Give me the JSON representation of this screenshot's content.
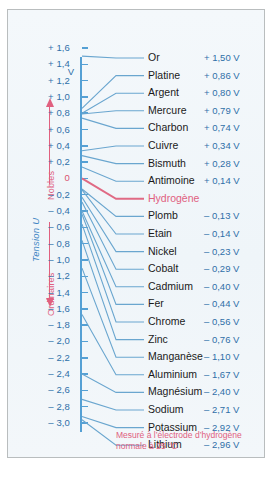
{
  "figure": {
    "axis": {
      "title": "Tension U",
      "unit": "V",
      "zone_upper": "Nobles",
      "zone_lower": "Ordinaires",
      "ticks": [
        "+ 1,6",
        "+ 1,4",
        "+ 1,2",
        "+ 1,0",
        "+ 0,8",
        "+ 0,6",
        "+ 0,4",
        "+ 0,2",
        "0",
        "– 0,2",
        "– 0,4",
        "– 0,6",
        "– 0,8",
        "– 1,0",
        "– 1,2",
        "– 1,4",
        "– 1,6",
        "– 1,8",
        "– 2,0",
        "– 2,2",
        "– 2,4",
        "– 2,6",
        "– 2,8",
        "– 3,0"
      ]
    },
    "caption": "Mesuré à l’électrode d’hydrogène normale à 25 °C",
    "colors": {
      "accent_blue": "#2f6fa8",
      "axis_blue": "#55a0d4",
      "highlight_red": "#e0607f",
      "background": "#f2f7fb"
    }
  },
  "chart_data": {
    "type": "scatter",
    "title": "Tension U",
    "xlabel": "",
    "ylabel": "Tension U",
    "unit": "V",
    "ylim": [
      -3.0,
      1.6
    ],
    "grid": false,
    "legend": "none",
    "annotations": [
      "Nobles",
      "Ordinaires",
      "Mesuré à l’électrode d’hydrogène normale à 25 °C"
    ],
    "tick_labels": [
      "+ 1,6",
      "+ 1,4",
      "+ 1,2",
      "+ 1,0",
      "+ 0,8",
      "+ 0,6",
      "+ 0,4",
      "+ 0,2",
      "0",
      "– 0,2",
      "– 0,4",
      "– 0,6",
      "– 0,8",
      "– 1,0",
      "– 1,2",
      "– 1,4",
      "– 1,6",
      "– 1,8",
      "– 2,0",
      "– 2,2",
      "– 2,4",
      "– 2,6",
      "– 2,8",
      "– 3,0"
    ],
    "categories": [
      "Or",
      "Platine",
      "Argent",
      "Mercure",
      "Charbon",
      "Cuivre",
      "Bismuth",
      "Antimoine",
      "Hydrogène",
      "Plomb",
      "Etain",
      "Nickel",
      "Cobalt",
      "Cadmium",
      "Fer",
      "Chrome",
      "Zinc",
      "Manganèse",
      "Aluminium",
      "Magnésium",
      "Sodium",
      "Potassium",
      "Lithium"
    ],
    "values": [
      1.5,
      0.86,
      0.8,
      0.79,
      0.74,
      0.34,
      0.28,
      0.14,
      0.0,
      -0.13,
      -0.14,
      -0.23,
      -0.29,
      -0.4,
      -0.44,
      -0.56,
      -0.76,
      -1.1,
      -1.67,
      -2.4,
      -2.71,
      -2.92,
      -2.96
    ],
    "value_labels": [
      "+ 1,50 V",
      "+ 0,86 V",
      "+ 0,80 V",
      "+ 0,79 V",
      "+ 0,74 V",
      "+ 0,34 V",
      "+ 0,28 V",
      "+ 0,14 V",
      "",
      "– 0,13 V",
      "– 0,14 V",
      "– 0,23 V",
      "– 0,29 V",
      "– 0,40 V",
      "– 0,44 V",
      "– 0,56 V",
      "– 0,76 V",
      "– 1,10 V",
      "– 1,67 V",
      "– 2,40 V",
      "– 2,71 V",
      "– 2,92 V",
      "– 2,96 V"
    ]
  }
}
